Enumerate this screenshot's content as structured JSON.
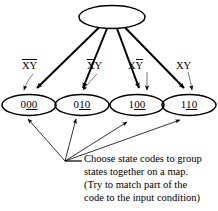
{
  "diagram": {
    "type": "state-encoding-fanout",
    "root_node": {
      "label": "",
      "shape": "ellipse"
    },
    "state_nodes": [
      {
        "code": "000",
        "prefix": "0",
        "underlined": "00"
      },
      {
        "code": "010",
        "prefix": "0",
        "underlined": "10"
      },
      {
        "code": "100",
        "prefix": "1",
        "underlined": "00"
      },
      {
        "code": "110",
        "prefix": "1",
        "underlined": "10"
      }
    ],
    "transition_conditions": [
      {
        "x_bar": true,
        "y_bar": true,
        "text": "XY"
      },
      {
        "x_bar": true,
        "y_bar": false,
        "text": "XY"
      },
      {
        "x_bar": false,
        "y_bar": true,
        "text": "XY"
      },
      {
        "x_bar": false,
        "y_bar": false,
        "text": "XY"
      }
    ],
    "caption_lines": [
      "Choose state codes to group",
      "states together on a map.",
      "(Try to match part of the",
      "code to the input condition)"
    ],
    "colors": {
      "stroke": "#000000",
      "text": "#000000",
      "background": "#ffffff"
    }
  }
}
